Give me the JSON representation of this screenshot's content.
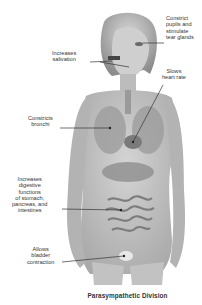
{
  "diagram": {
    "title": "Parasympathetic Division",
    "colors": {
      "background": "#ffffff",
      "skin": "#bdbdbd",
      "organs": "#8a8a8a",
      "leader_line": "#333333",
      "text": "#333333"
    },
    "labels": [
      {
        "id": "pupils",
        "lines": [
          "Constrict",
          "pupils and",
          "stimulate",
          "tear glands"
        ],
        "target": "eye"
      },
      {
        "id": "salivation",
        "lines": [
          "Increases",
          "salivation"
        ],
        "target": "salivary glands"
      },
      {
        "id": "heart",
        "lines": [
          "Slows",
          "heart rate"
        ],
        "target": "heart"
      },
      {
        "id": "bronchi",
        "lines": [
          "Constricts",
          "bronchi"
        ],
        "target": "lungs"
      },
      {
        "id": "digestion",
        "lines": [
          "Increases",
          "digestive",
          "functions",
          "of stomach,",
          "pancreas, and",
          "intestines"
        ],
        "target": "intestines"
      },
      {
        "id": "bladder",
        "lines": [
          "Allows",
          "bladder",
          "contraction"
        ],
        "target": "bladder"
      }
    ]
  }
}
